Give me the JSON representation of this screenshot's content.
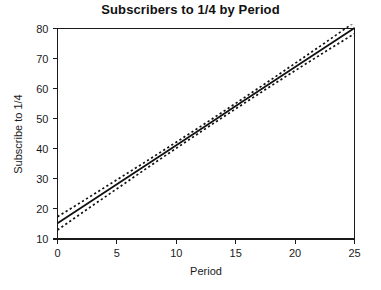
{
  "chart_data": {
    "type": "line",
    "title": "Subscribers to 1/4 by Period",
    "xlabel": "Period",
    "ylabel": "Subscribe to 1/4",
    "xlim": [
      0,
      25
    ],
    "ylim": [
      10,
      80
    ],
    "xticks": [
      0,
      5,
      10,
      15,
      20,
      25
    ],
    "yticks": [
      10,
      20,
      30,
      40,
      50,
      60,
      70,
      80
    ],
    "xtick_labels": [
      "0",
      "5",
      "10",
      "15",
      "20",
      "25"
    ],
    "ytick_labels": [
      "10",
      "20",
      "30",
      "40",
      "50",
      "60",
      "70",
      "80"
    ],
    "grid": false,
    "legend": "none",
    "frame": "box",
    "background": "#ffffff",
    "line_color": "#111111",
    "x": [
      0,
      2.5,
      5,
      7.5,
      10,
      12.5,
      15,
      17.5,
      20,
      22.5,
      25
    ],
    "series": [
      {
        "name": "Fitted regression line",
        "style": "solid",
        "values": [
          15.2,
          21.7,
          28.2,
          34.7,
          41.2,
          47.7,
          54.2,
          60.7,
          67.2,
          73.7,
          80.2
        ]
      },
      {
        "name": "Upper confidence band",
        "style": "dashed",
        "values": [
          17.4,
          23.5,
          29.7,
          35.9,
          42.2,
          48.6,
          55.1,
          61.7,
          68.4,
          75.2,
          82.1
        ]
      },
      {
        "name": "Lower confidence band",
        "style": "dashed",
        "values": [
          13.0,
          19.9,
          26.7,
          33.5,
          40.2,
          46.8,
          53.3,
          59.7,
          66.0,
          72.2,
          78.3
        ]
      }
    ]
  },
  "figure": {
    "title": "Subscribers to 1/4 by Period"
  }
}
